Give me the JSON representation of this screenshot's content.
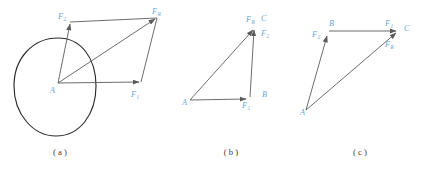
{
  "figure": {
    "kind": "force-vector-addition-diagram",
    "colors": {
      "vector_stroke": "#5b5b5b",
      "body_outline": "#2c2c2c",
      "label_color": "#6aa8d8",
      "caption_color": "#3b3b3b",
      "background": "#ffffff"
    },
    "panels": [
      {
        "id": "a",
        "caption": "( a )",
        "caption_x": 60,
        "caption_y": 155,
        "labels": [
          {
            "name": "label-a-F2",
            "base": "F",
            "sub": "2",
            "x": 58,
            "y": 19,
            "sub_dx": 5.6,
            "sub_dy": 2.2
          },
          {
            "name": "label-a-FR",
            "base": "F",
            "sub": "R",
            "x": 152,
            "y": 14,
            "sub_dx": 5.6,
            "sub_dy": 2.2
          },
          {
            "name": "label-a-A",
            "base": "A",
            "sub": "",
            "x": 50,
            "y": 93,
            "sub_dx": 0,
            "sub_dy": 0
          },
          {
            "name": "label-a-F1",
            "base": "F",
            "sub": "1",
            "x": 131,
            "y": 97,
            "sub_dx": 5.6,
            "sub_dy": 2.2
          }
        ]
      },
      {
        "id": "b",
        "caption": "( b )",
        "caption_x": 231,
        "caption_y": 155,
        "labels": [
          {
            "name": "label-b-FR",
            "base": "F",
            "sub": "R",
            "x": 246,
            "y": 22,
            "sub_dx": 5.6,
            "sub_dy": 2.2
          },
          {
            "name": "label-b-C",
            "base": "C",
            "sub": "",
            "x": 261,
            "y": 21,
            "sub_dx": 0,
            "sub_dy": 0
          },
          {
            "name": "label-b-F2",
            "base": "F",
            "sub": "2",
            "x": 261,
            "y": 36,
            "sub_dx": 5.6,
            "sub_dy": 2.2
          },
          {
            "name": "label-b-A",
            "base": "A",
            "sub": "",
            "x": 182,
            "y": 105,
            "sub_dx": 0,
            "sub_dy": 0
          },
          {
            "name": "label-b-B",
            "base": "B",
            "sub": "",
            "x": 262,
            "y": 97,
            "sub_dx": 0,
            "sub_dy": 0
          },
          {
            "name": "label-b-F1",
            "base": "F",
            "sub": "1",
            "x": 242,
            "y": 108,
            "sub_dx": 5.6,
            "sub_dy": 2.2
          }
        ]
      },
      {
        "id": "c",
        "caption": "( c )",
        "caption_x": 360,
        "caption_y": 155,
        "labels": [
          {
            "name": "label-c-B",
            "base": "B",
            "sub": "",
            "x": 329,
            "y": 26,
            "sub_dx": 0,
            "sub_dy": 0
          },
          {
            "name": "label-c-F2",
            "base": "F",
            "sub": "2",
            "x": 312,
            "y": 37,
            "sub_dx": 5.6,
            "sub_dy": 2.2
          },
          {
            "name": "label-c-F1",
            "base": "F",
            "sub": "1",
            "x": 385,
            "y": 26,
            "sub_dx": 5.6,
            "sub_dy": 2.2
          },
          {
            "name": "label-c-C",
            "base": "C",
            "sub": "",
            "x": 404,
            "y": 31,
            "sub_dx": 0,
            "sub_dy": 0
          },
          {
            "name": "label-c-FR",
            "base": "F",
            "sub": "R",
            "x": 385,
            "y": 47,
            "sub_dx": 5.6,
            "sub_dy": 2.2
          },
          {
            "name": "label-c-A",
            "base": "A",
            "sub": "",
            "x": 300,
            "y": 115,
            "sub_dx": 0,
            "sub_dy": 0
          }
        ]
      }
    ]
  }
}
